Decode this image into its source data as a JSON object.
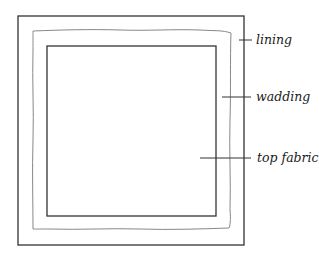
{
  "diagram": {
    "labels": {
      "lining": "lining",
      "wadding": "wadding",
      "top_fabric": "top fabric"
    },
    "colors": {
      "line": "#333333",
      "wadding_line": "#777777",
      "text": "#1a1a1a"
    }
  }
}
